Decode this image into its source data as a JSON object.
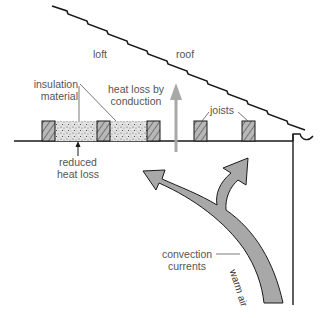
{
  "labels": {
    "loft": "loft",
    "roof": "roof",
    "insulation_line1": "insulation",
    "insulation_line2": "material",
    "heat_loss_line1": "heat loss by",
    "heat_loss_line2": "conduction",
    "joists": "joists",
    "reduced_line1": "reduced",
    "reduced_line2": "heat loss",
    "convection_line1": "convection",
    "convection_line2": "currents",
    "warm_air": "warm air"
  },
  "colors": {
    "line": "#1a1a1a",
    "arrow_fill": "#a8a8a8",
    "label_text": "#555555",
    "insulation": "#d8d8d8"
  }
}
